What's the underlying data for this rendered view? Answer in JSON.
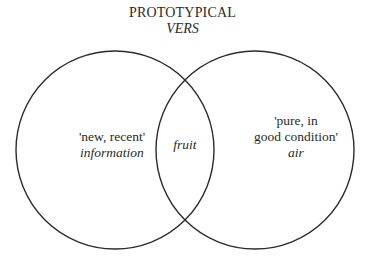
{
  "title": {
    "line1": "PROTOTYPICAL",
    "line2": "VERS"
  },
  "diagram": {
    "type": "venn",
    "sets": [
      {
        "name": "left-circle",
        "sense": "'new, recent'",
        "example": "information"
      },
      {
        "name": "right-circle",
        "sense_line1": "'pure, in",
        "sense_line2": "good condition'",
        "example": "air"
      }
    ],
    "intersection": {
      "example": "fruit"
    }
  }
}
